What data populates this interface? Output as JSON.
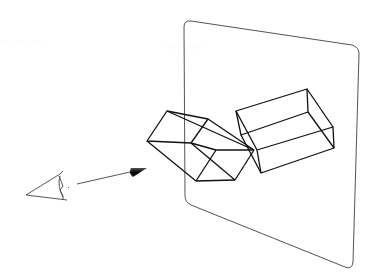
{
  "figure": {
    "background": "#ffffff",
    "stroke_color": "#111111",
    "plane_color": "#555555",
    "plane": {
      "corners": [
        [
          184,
          20
        ],
        [
          359,
          47
        ],
        [
          352,
          269
        ],
        [
          185,
          202
        ]
      ],
      "label": "projection-plane"
    },
    "box_front": {
      "label": "box-in-front-of-plane",
      "vertices": {
        "A": [
          167,
          111
        ],
        "B": [
          147,
          141
        ],
        "C": [
          208,
          119
        ],
        "D": [
          191,
          143
        ],
        "E": [
          216,
          150
        ],
        "F": [
          254,
          150
        ],
        "G": [
          196,
          181
        ],
        "H": [
          235,
          180
        ]
      }
    },
    "box_behind": {
      "label": "box-behind-plane",
      "vertices": {
        "A": [
          236,
          111
        ],
        "B": [
          307,
          89
        ],
        "C": [
          241,
          135
        ],
        "D": [
          308,
          112
        ],
        "E": [
          257,
          150
        ],
        "F": [
          333,
          127
        ],
        "G": [
          261,
          173
        ],
        "H": [
          334,
          148
        ]
      }
    },
    "eye": {
      "label": "viewer-eye",
      "position": [
        40,
        185
      ]
    },
    "arrow": {
      "label": "viewing-direction",
      "from": [
        77,
        184
      ],
      "to": [
        147,
        168
      ]
    }
  }
}
